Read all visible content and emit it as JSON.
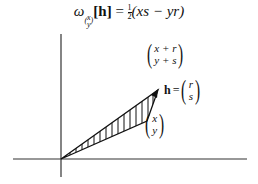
{
  "formula": {
    "omega": "ω",
    "subscript_top": "x",
    "subscript_bottom": "y",
    "bracket_open": "[",
    "h": "h",
    "bracket_close": "]",
    "equals": " = ",
    "frac_num": "1",
    "frac_den": "2",
    "expression": "(xs − yr)"
  },
  "labels": {
    "sum_vector": {
      "top": "x + r",
      "bottom": "y + s"
    },
    "h_vector": {
      "name": "h",
      "equals": "=",
      "top": "r",
      "bottom": "s"
    },
    "base_vector": {
      "top": "x",
      "bottom": "y"
    }
  },
  "geometry": {
    "origin": [
      61,
      159
    ],
    "point_xy": [
      147,
      121
    ],
    "point_sum": [
      158,
      90
    ],
    "x_axis": [
      13,
      247
    ],
    "y_axis": [
      34,
      177
    ],
    "line_color": "#111111"
  }
}
